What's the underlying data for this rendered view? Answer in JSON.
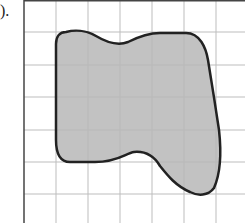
{
  "problem": {
    "label": ")."
  },
  "grid": {
    "origin_x": 24,
    "origin_y": 0,
    "cell_size": 32.3,
    "columns": 7,
    "rows": 7,
    "line_color": "#bdbdbd",
    "border_color": "#444444"
  },
  "shape": {
    "description": "irregular closed blob shaded gray on grid",
    "fill_color": "#b7b7b7",
    "stroke_color": "#222222"
  }
}
